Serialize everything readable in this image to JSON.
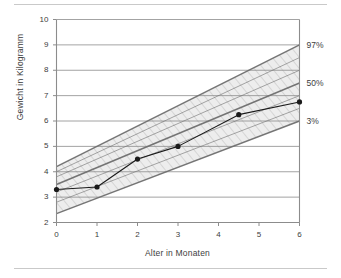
{
  "figure": {
    "has_top_rule": true,
    "has_bottom_rule": true,
    "rule_color": "#c9c9c9",
    "background": "#ffffff"
  },
  "chart_data": {
    "type": "line",
    "title": "",
    "subtitle": "",
    "xlabel": "Alter in Monaten",
    "ylabel": "Gewicht in Kilogramm",
    "xlim": [
      0,
      6
    ],
    "ylim": [
      2,
      10
    ],
    "xticks": [
      0,
      1,
      2,
      3,
      4,
      5,
      6
    ],
    "xticklabels": [
      "0",
      "1",
      "2",
      "3",
      "4",
      "5",
      "6"
    ],
    "yticks": [
      2,
      3,
      4,
      5,
      6,
      7,
      8,
      9,
      10
    ],
    "yticklabels": [
      "2",
      "3",
      "4",
      "5",
      "6",
      "7",
      "8",
      "9",
      "10"
    ],
    "grid": "horizontal",
    "grid_color": "#8c8c8c",
    "axis_color": "#8c8c8c",
    "legend_position": "right-outside",
    "series": [
      {
        "name": "Messwerte",
        "type": "line-markers",
        "color": "#1a1a1a",
        "marker": "circle",
        "x": [
          0,
          1,
          2,
          3,
          4.5,
          6
        ],
        "y": [
          3.3,
          3.4,
          4.5,
          5.0,
          6.25,
          6.75
        ]
      }
    ],
    "reference_bands": {
      "fill_color": "#e8e8e8",
      "line_color": "#6e6e6e",
      "description": "Perzentilenkurven als schraffiertes Band",
      "curves": [
        {
          "label": "97%",
          "x": [
            0,
            6
          ],
          "y": [
            4.2,
            9.0
          ],
          "emphasis": "strong"
        },
        {
          "label": "",
          "x": [
            0,
            6
          ],
          "y": [
            4.0,
            8.5
          ],
          "emphasis": "light"
        },
        {
          "label": "",
          "x": [
            0,
            6
          ],
          "y": [
            3.8,
            8.0
          ],
          "emphasis": "light"
        },
        {
          "label": "50%",
          "x": [
            0,
            6
          ],
          "y": [
            3.5,
            7.5
          ],
          "emphasis": "strong"
        },
        {
          "label": "",
          "x": [
            0,
            6
          ],
          "y": [
            3.2,
            7.0
          ],
          "emphasis": "light"
        },
        {
          "label": "",
          "x": [
            0,
            6
          ],
          "y": [
            2.8,
            6.5
          ],
          "emphasis": "light"
        },
        {
          "label": "3%",
          "x": [
            0,
            6
          ],
          "y": [
            2.35,
            6.0
          ],
          "emphasis": "strong"
        }
      ],
      "band_top": {
        "x": [
          0,
          6
        ],
        "y": [
          4.2,
          9.0
        ]
      },
      "band_bottom": {
        "x": [
          0,
          6
        ],
        "y": [
          2.35,
          6.0
        ]
      }
    },
    "annotations": [
      {
        "text": "97%",
        "x": 6,
        "y": 9.0,
        "placement": "right"
      },
      {
        "text": "50%",
        "x": 6,
        "y": 7.5,
        "placement": "right"
      },
      {
        "text": "3%",
        "x": 6,
        "y": 6.0,
        "placement": "right"
      }
    ]
  }
}
